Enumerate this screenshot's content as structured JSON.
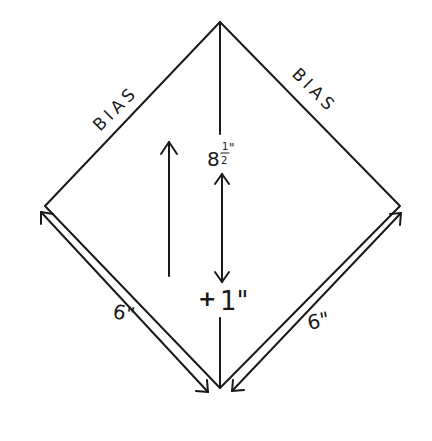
{
  "diagram": {
    "type": "pattern-piece",
    "shape": "diamond (square on point)",
    "colors": {
      "ink": "#1a1a1a",
      "background": "#ffffff"
    },
    "labels": {
      "edge_top_left": "BIAS",
      "edge_top_right": "BIAS",
      "center_length": "8½\"",
      "center_length_whole": "8",
      "center_length_frac_num": "1",
      "center_length_frac_den": "2",
      "center_length_inch": "\"",
      "allowance": "+ 1\"",
      "allowance_plus": "+",
      "allowance_value": "1\"",
      "edge_bottom_left": "6\"",
      "edge_bottom_right": "6\""
    },
    "arrows": [
      {
        "name": "grainline-arrow",
        "direction": "up"
      },
      {
        "name": "center-dimension-arrow",
        "direction": "both"
      },
      {
        "name": "bottom-left-dimension-arrow",
        "direction": "both"
      },
      {
        "name": "bottom-right-dimension-arrow",
        "direction": "both"
      }
    ]
  }
}
